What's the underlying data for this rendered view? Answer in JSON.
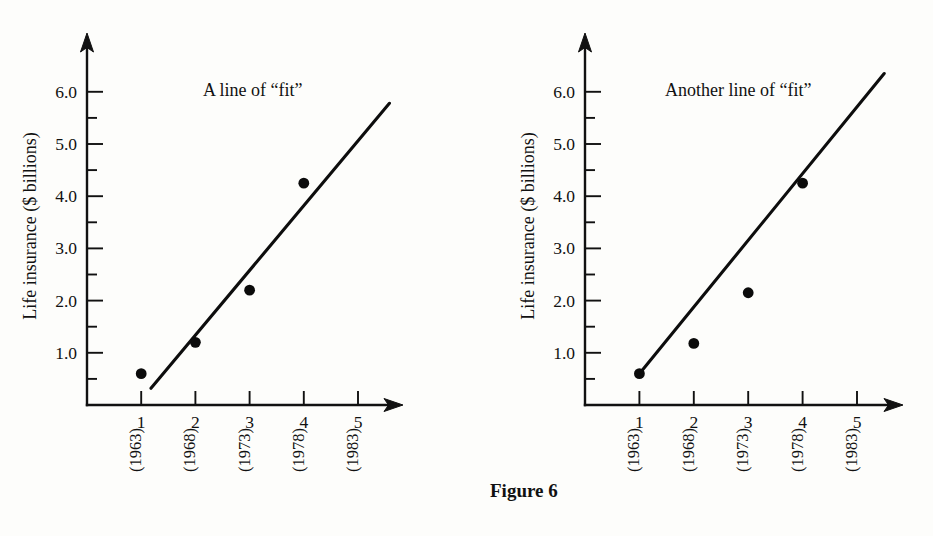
{
  "figure": {
    "caption": "Figure 6"
  },
  "chart_data": [
    {
      "type": "scatter",
      "id": "left",
      "title": "",
      "annotation": "A line of “fit”",
      "xlabel": "",
      "ylabel": "Life insurance ($ billions)",
      "categories": [
        "1",
        "2",
        "3",
        "4",
        "5"
      ],
      "category_sublabels": [
        "(1963)",
        "(1968)",
        "(1973)",
        "(1978)",
        "(1983)"
      ],
      "x": [
        1,
        2,
        3,
        4
      ],
      "values": [
        0.6,
        1.2,
        2.2,
        4.25
      ],
      "xlim": [
        0,
        5.6
      ],
      "ylim": [
        0,
        6.6
      ],
      "ytick_labels": [
        "1.0",
        "2.0",
        "3.0",
        "4.0",
        "5.0",
        "6.0"
      ],
      "ytick_values": [
        1.0,
        2.0,
        3.0,
        4.0,
        5.0,
        6.0
      ],
      "yminor_values": [
        0.5,
        1.5,
        2.5,
        3.5,
        4.5,
        5.5
      ],
      "grid": "off",
      "legend": "none",
      "fit_line": {
        "x_start": 1.18,
        "y_start": 0.32,
        "x_end": 5.58,
        "y_end": 5.78
      }
    },
    {
      "type": "scatter",
      "id": "right",
      "title": "",
      "annotation": "Another line of “fit”",
      "xlabel": "",
      "ylabel": "Life insurance ($ billions)",
      "categories": [
        "1",
        "2",
        "3",
        "4",
        "5"
      ],
      "category_sublabels": [
        "(1963)",
        "(1968)",
        "(1973)",
        "(1978)",
        "(1983)"
      ],
      "x": [
        1,
        2,
        3,
        4
      ],
      "values": [
        0.6,
        1.18,
        2.15,
        4.25
      ],
      "xlim": [
        0,
        5.6
      ],
      "ylim": [
        0,
        6.6
      ],
      "ytick_labels": [
        "1.0",
        "2.0",
        "3.0",
        "4.0",
        "5.0",
        "6.0"
      ],
      "ytick_values": [
        1.0,
        2.0,
        3.0,
        4.0,
        5.0,
        6.0
      ],
      "yminor_values": [
        0.5,
        1.5,
        2.5,
        3.5,
        4.5,
        5.5
      ],
      "grid": "off",
      "legend": "none",
      "fit_line": {
        "x_start": 1.0,
        "y_start": 0.6,
        "x_end": 5.5,
        "y_end": 6.35
      }
    }
  ],
  "colors": {
    "ink": "#111111",
    "background": "#fdfdfb",
    "point": "#0b0b0b"
  }
}
